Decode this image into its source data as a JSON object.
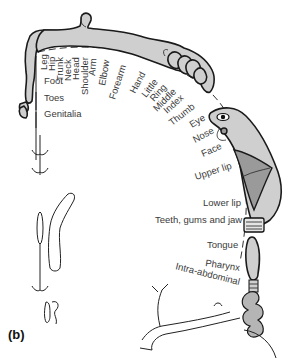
{
  "diagram": {
    "panel_label": "(b)",
    "labels": {
      "leg": "Leg",
      "hip": "Hip",
      "trunk": "Trunk",
      "neck": "Neck",
      "head": "Head",
      "shoulder": "Shoulder",
      "arm": "Arm",
      "elbow": "Elbow",
      "forearm": "Forearm",
      "hand": "Hand",
      "little": "Little",
      "ring": "Ring",
      "middle": "Middle",
      "index": "Index",
      "thumb": "Thumb",
      "eye": "Eye",
      "nose": "Nose",
      "face": "Face",
      "upper_lip": "Upper lip",
      "lower_lip": "Lower lip",
      "teeth": "Teeth, gums and jaw",
      "tongue": "Tongue",
      "pharynx": "Pharynx",
      "intra_abdominal": "Intra-abdominal",
      "foot": "Foot",
      "toes": "Toes",
      "genitalia": "Genitalia"
    },
    "colors": {
      "body_fill": "#cfcfcf",
      "lip_fill": "#9a9a9a",
      "outline": "#1a1a1a",
      "text": "#3a3a3a"
    }
  }
}
